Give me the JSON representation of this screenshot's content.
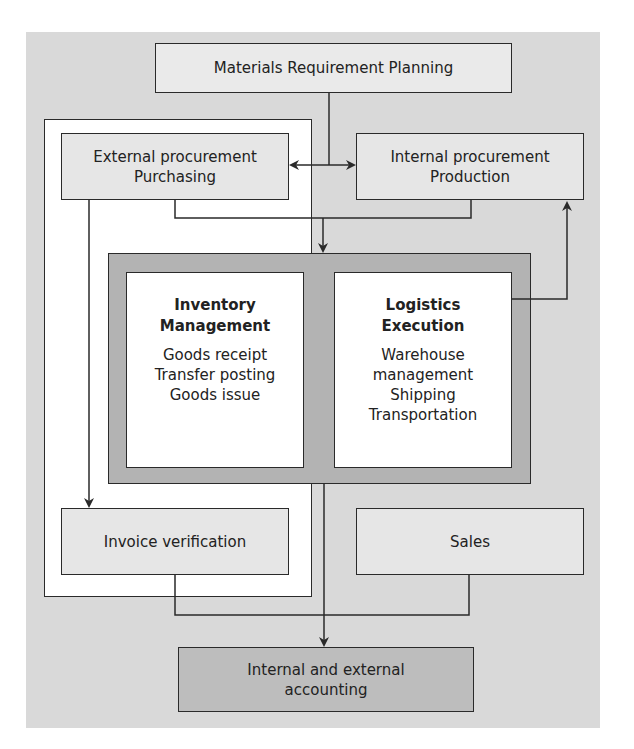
{
  "diagram": {
    "mrp": "Materials Requirement Planning",
    "external": {
      "line1": "External procurement",
      "line2": "Purchasing"
    },
    "internal": {
      "line1": "Internal procurement",
      "line2": "Production"
    },
    "inventory": {
      "title1": "Inventory",
      "title2": "Management",
      "items": [
        "Goods receipt",
        "Transfer posting",
        "Goods issue"
      ]
    },
    "logistics": {
      "title1": "Logistics",
      "title2": "Execution",
      "items": [
        "Warehouse",
        "management",
        "Shipping",
        "Transportation"
      ]
    },
    "invoice": "Invoice verification",
    "sales": "Sales",
    "accounting": {
      "line1": "Internal and external",
      "line2": "accounting"
    }
  },
  "colors": {
    "background": "#d9d9d9",
    "box_light": "#e6e6e6",
    "box_dark": "#b3b3b3",
    "frame_white": "#ffffff",
    "line": "#2a2a2a"
  }
}
